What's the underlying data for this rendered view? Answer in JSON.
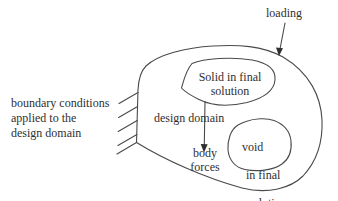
{
  "canvas": {
    "width": 338,
    "height": 201,
    "background_color": "#ffffff",
    "stroke_color": "#4a4a4a",
    "text_color": "#2f2f2f"
  },
  "labels": {
    "loading": "loading",
    "boundary_conditions": "boundary conditions\napplied to the\ndesign domain",
    "design_domain": "design domain",
    "body_forces": "body\nforces",
    "solid_region": "Solid in final\nsolution",
    "void_region": {
      "line1": "void",
      "line2": "in final",
      "line3": "solution"
    }
  },
  "icons": {
    "loading_arrow": "down-arrow",
    "body_forces_arrow": "down-arrow",
    "boundary_hatching": "fixed-support-hatch-marks"
  }
}
